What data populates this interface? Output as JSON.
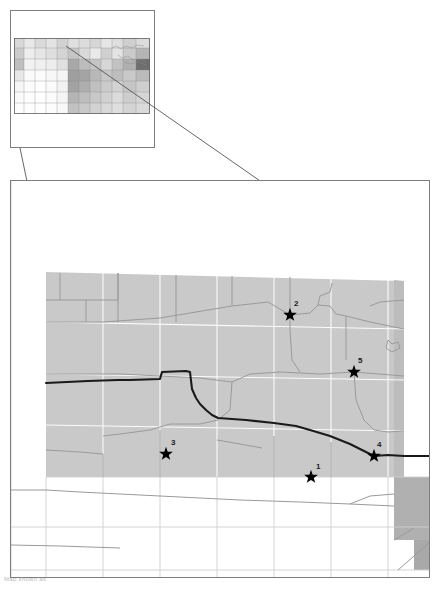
{
  "figure": {
    "caption": "Map shown as"
  },
  "colors": {
    "frame_stroke": "#7d7d7d",
    "connector_stroke": "#555555",
    "region_fill": "#c9c9c9",
    "region_fill_dark": "#a9a9a9",
    "region_fill_light": "#e2e2e2",
    "county_line": "#ffffff",
    "road_line": "#9a9a9a",
    "major_line": "#1a1a1a",
    "inset_light": "#efefef",
    "inset_mid": "#cfcfcf",
    "inset_dark": "#9c9c9c",
    "inset_darkest": "#6e6e6e",
    "star_fill": "#000000",
    "background": "#ffffff"
  },
  "inset_map": {
    "name": "state-overview-inset",
    "title": "",
    "frame": {
      "x": 10,
      "y": 10,
      "width": 145,
      "height": 138
    },
    "state_outline": {
      "x": 14,
      "y": 38,
      "width": 136,
      "height": 76
    },
    "shaded_counties": [
      {
        "x": 14,
        "y": 38,
        "w": 10,
        "h": 10,
        "shade": "#d8d8d8"
      },
      {
        "x": 24,
        "y": 38,
        "w": 11,
        "h": 10,
        "shade": "#e8e8e8"
      },
      {
        "x": 35,
        "y": 38,
        "w": 11,
        "h": 10,
        "shade": "#dadada"
      },
      {
        "x": 46,
        "y": 38,
        "w": 11,
        "h": 10,
        "shade": "#e4e4e4"
      },
      {
        "x": 57,
        "y": 38,
        "w": 11,
        "h": 10,
        "shade": "#d2d2d2"
      },
      {
        "x": 68,
        "y": 38,
        "w": 11,
        "h": 10,
        "shade": "#e0e0e0"
      },
      {
        "x": 79,
        "y": 38,
        "w": 11,
        "h": 10,
        "shade": "#dcdcdc"
      },
      {
        "x": 90,
        "y": 38,
        "w": 11,
        "h": 10,
        "shade": "#d6d6d6"
      },
      {
        "x": 101,
        "y": 38,
        "w": 11,
        "h": 10,
        "shade": "#e6e6e6"
      },
      {
        "x": 112,
        "y": 38,
        "w": 11,
        "h": 10,
        "shade": "#dedede"
      },
      {
        "x": 123,
        "y": 38,
        "w": 13,
        "h": 10,
        "shade": "#cfcfcf"
      },
      {
        "x": 136,
        "y": 38,
        "w": 14,
        "h": 10,
        "shade": "#dddddd"
      },
      {
        "x": 14,
        "y": 48,
        "w": 10,
        "h": 11,
        "shade": "#cccccc"
      },
      {
        "x": 24,
        "y": 48,
        "w": 11,
        "h": 11,
        "shade": "#ededed"
      },
      {
        "x": 35,
        "y": 48,
        "w": 11,
        "h": 11,
        "shade": "#e6e6e6"
      },
      {
        "x": 46,
        "y": 48,
        "w": 11,
        "h": 11,
        "shade": "#dfdfdf"
      },
      {
        "x": 57,
        "y": 48,
        "w": 11,
        "h": 11,
        "shade": "#d4d4d4"
      },
      {
        "x": 68,
        "y": 48,
        "w": 11,
        "h": 11,
        "shade": "#c6c6c6"
      },
      {
        "x": 79,
        "y": 48,
        "w": 11,
        "h": 11,
        "shade": "#d9d9d9"
      },
      {
        "x": 90,
        "y": 48,
        "w": 11,
        "h": 11,
        "shade": "#e9e9e9"
      },
      {
        "x": 101,
        "y": 48,
        "w": 11,
        "h": 11,
        "shade": "#d0d0d0"
      },
      {
        "x": 112,
        "y": 48,
        "w": 11,
        "h": 11,
        "shade": "#e3e3e3"
      },
      {
        "x": 123,
        "y": 48,
        "w": 13,
        "h": 11,
        "shade": "#cacaca"
      },
      {
        "x": 136,
        "y": 48,
        "w": 14,
        "h": 11,
        "shade": "#b5b5b5"
      },
      {
        "x": 14,
        "y": 59,
        "w": 10,
        "h": 11,
        "shade": "#bfbfbf"
      },
      {
        "x": 24,
        "y": 59,
        "w": 11,
        "h": 11,
        "shade": "#f2f2f2"
      },
      {
        "x": 35,
        "y": 59,
        "w": 11,
        "h": 11,
        "shade": "#f0f0f0"
      },
      {
        "x": 46,
        "y": 59,
        "w": 11,
        "h": 11,
        "shade": "#ededed"
      },
      {
        "x": 57,
        "y": 59,
        "w": 11,
        "h": 11,
        "shade": "#e0e0e0"
      },
      {
        "x": 68,
        "y": 59,
        "w": 11,
        "h": 11,
        "shade": "#a8a8a8"
      },
      {
        "x": 79,
        "y": 59,
        "w": 11,
        "h": 11,
        "shade": "#bcbcbc"
      },
      {
        "x": 90,
        "y": 59,
        "w": 11,
        "h": 11,
        "shade": "#c4c4c4"
      },
      {
        "x": 101,
        "y": 59,
        "w": 11,
        "h": 11,
        "shade": "#d7d7d7"
      },
      {
        "x": 112,
        "y": 59,
        "w": 11,
        "h": 11,
        "shade": "#c2c2c2"
      },
      {
        "x": 123,
        "y": 59,
        "w": 13,
        "h": 11,
        "shade": "#b0b0b0"
      },
      {
        "x": 136,
        "y": 59,
        "w": 14,
        "h": 11,
        "shade": "#6e6e6e"
      },
      {
        "x": 14,
        "y": 70,
        "w": 10,
        "h": 11,
        "shade": "#e8e8e8"
      },
      {
        "x": 24,
        "y": 70,
        "w": 11,
        "h": 11,
        "shade": "#fafafa"
      },
      {
        "x": 35,
        "y": 70,
        "w": 11,
        "h": 11,
        "shade": "#fbfbfb"
      },
      {
        "x": 46,
        "y": 70,
        "w": 11,
        "h": 11,
        "shade": "#f7f7f7"
      },
      {
        "x": 57,
        "y": 70,
        "w": 11,
        "h": 11,
        "shade": "#f4f4f4"
      },
      {
        "x": 68,
        "y": 70,
        "w": 11,
        "h": 11,
        "shade": "#9f9f9f"
      },
      {
        "x": 79,
        "y": 70,
        "w": 11,
        "h": 11,
        "shade": "#a4a4a4"
      },
      {
        "x": 90,
        "y": 70,
        "w": 11,
        "h": 11,
        "shade": "#b8b8b8"
      },
      {
        "x": 101,
        "y": 70,
        "w": 11,
        "h": 11,
        "shade": "#c7c7c7"
      },
      {
        "x": 112,
        "y": 70,
        "w": 11,
        "h": 11,
        "shade": "#bdbdbd"
      },
      {
        "x": 123,
        "y": 70,
        "w": 13,
        "h": 11,
        "shade": "#c9c9c9"
      },
      {
        "x": 136,
        "y": 70,
        "w": 14,
        "h": 11,
        "shade": "#bbbbbb"
      },
      {
        "x": 14,
        "y": 81,
        "w": 10,
        "h": 11,
        "shade": "#f6f6f6"
      },
      {
        "x": 24,
        "y": 81,
        "w": 11,
        "h": 11,
        "shade": "#fcfcfc"
      },
      {
        "x": 35,
        "y": 81,
        "w": 11,
        "h": 11,
        "shade": "#fdfdfd"
      },
      {
        "x": 46,
        "y": 81,
        "w": 11,
        "h": 11,
        "shade": "#fafafa"
      },
      {
        "x": 57,
        "y": 81,
        "w": 11,
        "h": 11,
        "shade": "#f2f2f2"
      },
      {
        "x": 68,
        "y": 81,
        "w": 11,
        "h": 11,
        "shade": "#a2a2a2"
      },
      {
        "x": 79,
        "y": 81,
        "w": 11,
        "h": 11,
        "shade": "#aeaeae"
      },
      {
        "x": 90,
        "y": 81,
        "w": 11,
        "h": 11,
        "shade": "#c0c0c0"
      },
      {
        "x": 101,
        "y": 81,
        "w": 11,
        "h": 11,
        "shade": "#cbcbcb"
      },
      {
        "x": 112,
        "y": 81,
        "w": 11,
        "h": 11,
        "shade": "#d3d3d3"
      },
      {
        "x": 123,
        "y": 81,
        "w": 13,
        "h": 11,
        "shade": "#c5c5c5"
      },
      {
        "x": 136,
        "y": 81,
        "w": 14,
        "h": 11,
        "shade": "#cecece"
      },
      {
        "x": 14,
        "y": 92,
        "w": 10,
        "h": 11,
        "shade": "#fbfbfb"
      },
      {
        "x": 24,
        "y": 92,
        "w": 11,
        "h": 11,
        "shade": "#fdfdfd"
      },
      {
        "x": 35,
        "y": 92,
        "w": 11,
        "h": 11,
        "shade": "#fefefe"
      },
      {
        "x": 46,
        "y": 92,
        "w": 11,
        "h": 11,
        "shade": "#fbfbfb"
      },
      {
        "x": 57,
        "y": 92,
        "w": 11,
        "h": 11,
        "shade": "#f5f5f5"
      },
      {
        "x": 68,
        "y": 92,
        "w": 11,
        "h": 11,
        "shade": "#b4b4b4"
      },
      {
        "x": 79,
        "y": 92,
        "w": 11,
        "h": 11,
        "shade": "#bebebe"
      },
      {
        "x": 90,
        "y": 92,
        "w": 11,
        "h": 11,
        "shade": "#c8c8c8"
      },
      {
        "x": 101,
        "y": 92,
        "w": 11,
        "h": 11,
        "shade": "#d1d1d1"
      },
      {
        "x": 112,
        "y": 92,
        "w": 11,
        "h": 11,
        "shade": "#dbdbdb"
      },
      {
        "x": 123,
        "y": 92,
        "w": 13,
        "h": 11,
        "shade": "#cdcdcd"
      },
      {
        "x": 136,
        "y": 92,
        "w": 14,
        "h": 11,
        "shade": "#d5d5d5"
      },
      {
        "x": 14,
        "y": 103,
        "w": 10,
        "h": 11,
        "shade": "#fdfdfd"
      },
      {
        "x": 24,
        "y": 103,
        "w": 11,
        "h": 11,
        "shade": "#fefefe"
      },
      {
        "x": 35,
        "y": 103,
        "w": 11,
        "h": 11,
        "shade": "#fefefe"
      },
      {
        "x": 46,
        "y": 103,
        "w": 11,
        "h": 11,
        "shade": "#fcfcfc"
      },
      {
        "x": 57,
        "y": 103,
        "w": 11,
        "h": 11,
        "shade": "#f8f8f8"
      },
      {
        "x": 68,
        "y": 103,
        "w": 11,
        "h": 11,
        "shade": "#c1c1c1"
      },
      {
        "x": 79,
        "y": 103,
        "w": 11,
        "h": 11,
        "shade": "#c9c9c9"
      },
      {
        "x": 90,
        "y": 103,
        "w": 11,
        "h": 11,
        "shade": "#d2d2d2"
      },
      {
        "x": 101,
        "y": 103,
        "w": 11,
        "h": 11,
        "shade": "#d8d8d8"
      },
      {
        "x": 112,
        "y": 103,
        "w": 11,
        "h": 11,
        "shade": "#dfdfdf"
      },
      {
        "x": 123,
        "y": 103,
        "w": 13,
        "h": 11,
        "shade": "#d4d4d4"
      },
      {
        "x": 136,
        "y": 103,
        "w": 14,
        "h": 11,
        "shade": "#dadada"
      }
    ],
    "detail_region_outline": {
      "x": 60,
      "y": 42,
      "width": 90,
      "height": 40
    }
  },
  "main_map": {
    "name": "detail-map",
    "frame": {
      "x": 10,
      "y": 180,
      "width": 420,
      "height": 398
    },
    "study_area": {
      "label": "",
      "fill": "#c9c9c9"
    },
    "markers": [
      {
        "id": "1",
        "label": "1",
        "x": 311,
        "y": 477,
        "label_dx": 5,
        "label_dy": -8
      },
      {
        "id": "2",
        "label": "2",
        "x": 290,
        "y": 315,
        "label_dx": 4,
        "label_dy": -9
      },
      {
        "id": "3",
        "label": "3",
        "x": 166,
        "y": 454,
        "label_dx": 5,
        "label_dy": -9
      },
      {
        "id": "4",
        "label": "4",
        "x": 374,
        "y": 456,
        "label_dx": 3,
        "label_dy": -9
      },
      {
        "id": "5",
        "label": "5",
        "x": 354,
        "y": 372,
        "label_dx": 4,
        "label_dy": -9
      }
    ],
    "connector_lines": [
      {
        "name": "connector-left",
        "x1": 20,
        "y1": 148,
        "x2": 46,
        "y2": 272
      },
      {
        "name": "connector-right",
        "x1": 66,
        "y1": 46,
        "x2": 404,
        "y2": 280
      }
    ]
  }
}
